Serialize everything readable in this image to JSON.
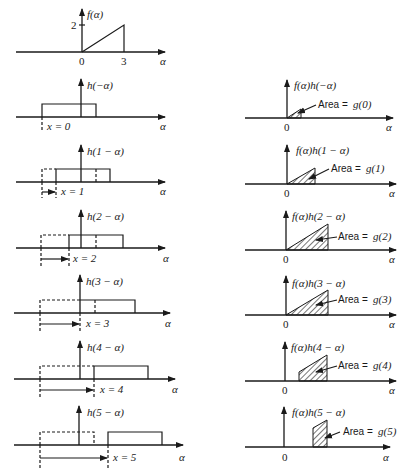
{
  "figure": {
    "top": {
      "ylabel": "f(α)",
      "ytick": "2",
      "xticks": [
        "0",
        "3"
      ],
      "xlabel": "α"
    },
    "left_panels": [
      {
        "label": "h(−α)",
        "shift_label": "x = 0",
        "xlabel": "α",
        "x": 0
      },
      {
        "label": "h(1 − α)",
        "shift_label": "x = 1",
        "xlabel": "α",
        "x": 1
      },
      {
        "label": "h(2 − α)",
        "shift_label": "x = 2",
        "xlabel": "α",
        "x": 2
      },
      {
        "label": "h(3 − α)",
        "shift_label": "x = 3",
        "xlabel": "α",
        "x": 3
      },
      {
        "label": "h(4 − α)",
        "shift_label": "x = 4",
        "xlabel": "α",
        "x": 4
      },
      {
        "label": "h(5 − α)",
        "shift_label": "x = 5",
        "xlabel": "α",
        "x": 5
      }
    ],
    "right_panels": [
      {
        "label": "f(α)h(−α)",
        "area_text": "Area =",
        "area_value": "g(0)",
        "origin": "0",
        "xlabel": "α"
      },
      {
        "label": "f(α)h(1 − α)",
        "area_text": "Area =",
        "area_value": "g(1)",
        "origin": "0",
        "xlabel": "α"
      },
      {
        "label": "f(α)h(2 − α)",
        "area_text": "Area =",
        "area_value": "g(2)",
        "origin": "0",
        "xlabel": "α"
      },
      {
        "label": "f(α)h(3 − α)",
        "area_text": "Area =",
        "area_value": "g(3)",
        "origin": "0",
        "xlabel": "α"
      },
      {
        "label": "f(α)h(4 − α)",
        "area_text": "Area =",
        "area_value": "g(4)",
        "origin": "0",
        "xlabel": "α"
      },
      {
        "label": "f(α)h(5 − α)",
        "area_text": "Area =",
        "area_value": "g(5)",
        "origin": "0",
        "xlabel": "α"
      }
    ]
  }
}
